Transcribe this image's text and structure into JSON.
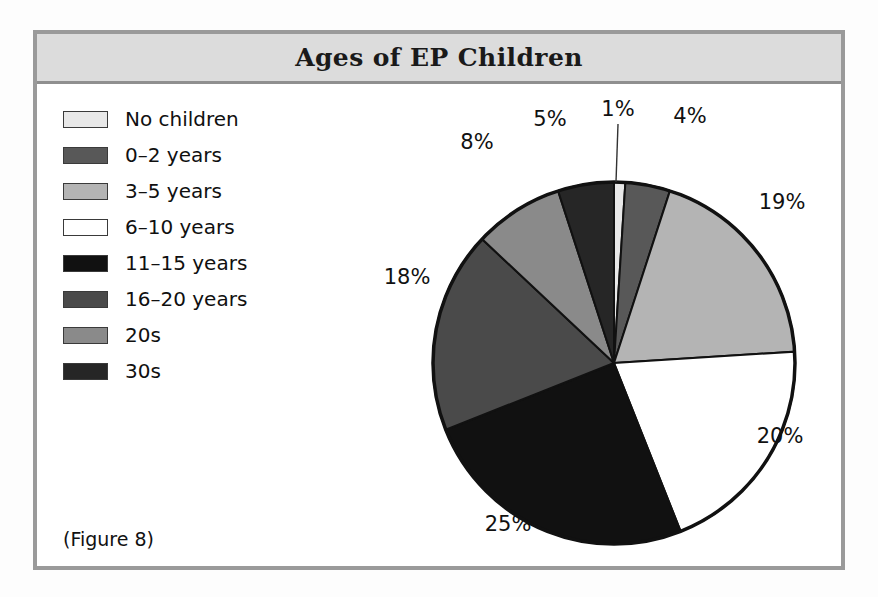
{
  "figure": {
    "title": "Ages of EP Children",
    "caption": "(Figure 8)"
  },
  "legend": {
    "items": [
      {
        "label": "No children",
        "color": "#e8e8e8"
      },
      {
        "label": "0–2 years",
        "color": "#585858"
      },
      {
        "label": "3–5 years",
        "color": "#b4b4b4"
      },
      {
        "label": "6–10 years",
        "color": "#ffffff"
      },
      {
        "label": "11–15 years",
        "color": "#111111"
      },
      {
        "label": "16–20 years",
        "color": "#4a4a4a"
      },
      {
        "label": "20s",
        "color": "#8a8a8a"
      },
      {
        "label": "30s",
        "color": "#262626"
      }
    ]
  },
  "chart_data": {
    "type": "pie",
    "title": "Ages of EP Children",
    "categories": [
      "No children",
      "0–2 years",
      "3–5 years",
      "6–10 years",
      "11–15 years",
      "16–20 years",
      "20s",
      "30s"
    ],
    "values": [
      1,
      4,
      19,
      20,
      25,
      18,
      8,
      5
    ],
    "value_labels": [
      "1%",
      "4%",
      "19%",
      "20%",
      "25%",
      "18%",
      "8%",
      "5%"
    ],
    "colors": [
      "#e8e8e8",
      "#585858",
      "#b4b4b4",
      "#ffffff",
      "#111111",
      "#4a4a4a",
      "#8a8a8a",
      "#262626"
    ],
    "unit": "percent",
    "total": 100,
    "start_angle_deg": 0,
    "direction": "clockwise",
    "legend_position": "left",
    "slice_outline_color": "#111111",
    "xlabel": "",
    "ylabel": ""
  },
  "labels": [
    {
      "text": "1%",
      "x": 306,
      "y": 25
    },
    {
      "text": "4%",
      "x": 378,
      "y": 32
    },
    {
      "text": "19%",
      "x": 470,
      "y": 118
    },
    {
      "text": "20%",
      "x": 468,
      "y": 352
    },
    {
      "text": "25%",
      "x": 196,
      "y": 440
    },
    {
      "text": "18%",
      "x": 95,
      "y": 193
    },
    {
      "text": "8%",
      "x": 165,
      "y": 58
    },
    {
      "text": "5%",
      "x": 238,
      "y": 35
    }
  ]
}
